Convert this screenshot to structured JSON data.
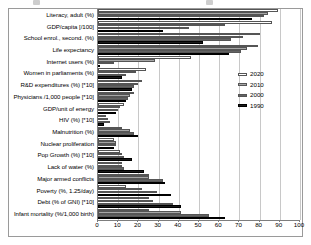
{
  "chart_data": {
    "type": "bar",
    "orientation": "horizontal",
    "title": "",
    "xlabel": "",
    "ylabel": "",
    "xlim": [
      0,
      100
    ],
    "xticks": [
      0,
      10,
      20,
      30,
      40,
      50,
      60,
      70,
      80,
      90,
      100
    ],
    "grid": true,
    "legend_position": "right",
    "categories": [
      "Literacy, adult (%)",
      "GDP/capita [/100]",
      "School enrol., second. (%)",
      "Life expectancy",
      "Internet users (%)",
      "Women in parliaments (%)",
      "R&D expenditures (%) [*10]",
      "Physicians /1,000 people [*10]",
      "GDP/unit of energy",
      "HIV (%) [*10]",
      "Malnutrition (%)",
      "Nuclear proliferation",
      "Pop Growth (%) [*10]",
      "Lack of water (%)",
      "Major armed conflicts",
      "Poverty (%, 1.25/day)",
      "Debt (% of GNI) [*10]",
      "Infant mortality (%/1,000 birth)"
    ],
    "series": [
      {
        "name": "2020",
        "color": "#ffffff",
        "values": [
          89,
          86,
          80,
          79,
          46,
          24,
          22,
          18,
          13,
          4,
          12,
          8,
          11,
          12,
          25,
          14,
          25,
          25
        ]
      },
      {
        "name": "2010",
        "color": "#a6a6a6",
        "values": [
          84,
          63,
          72,
          74,
          28,
          19,
          20,
          16,
          11,
          5,
          16,
          9,
          12,
          12,
          25,
          22,
          27,
          41
        ]
      },
      {
        "name": "2000",
        "color": "#636363",
        "values": [
          82,
          45,
          66,
          71,
          8,
          14,
          18,
          15,
          10,
          6,
          18,
          9,
          13,
          13,
          32,
          29,
          37,
          55
        ]
      },
      {
        "name": "1990",
        "color": "#1a1a1a",
        "values": [
          76,
          32,
          52,
          65,
          1,
          12,
          17,
          14,
          9,
          3,
          20,
          8,
          17,
          23,
          33,
          36,
          41,
          63
        ]
      }
    ]
  },
  "legend": {
    "items": [
      {
        "label": "2020",
        "swatch_class": "s2020"
      },
      {
        "label": "2010",
        "swatch_class": "s2010"
      },
      {
        "label": "2000",
        "swatch_class": "s2000"
      },
      {
        "label": "1990",
        "swatch_class": "s1990"
      }
    ]
  },
  "colors": {
    "series_2020": "#ffffff",
    "series_2010": "#a6a6a6",
    "series_2000": "#636363",
    "series_1990": "#1a1a1a",
    "gridline": "#c8c8c8",
    "axis": "#7d7d7d",
    "frame": "#9a9a9a",
    "text": "#000000"
  }
}
